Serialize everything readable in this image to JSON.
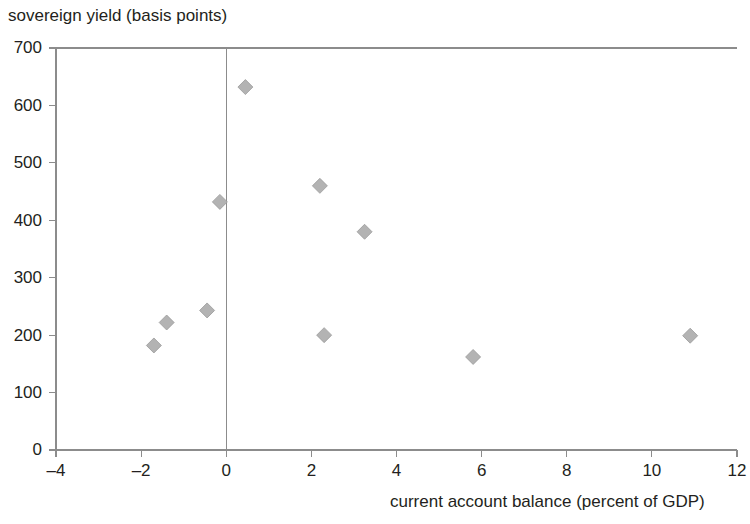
{
  "chart_data": {
    "type": "scatter",
    "title": "",
    "ylabel": "sovereign yield (basis points)",
    "xlabel": "current account balance (percent of GDP)",
    "xlim": [
      -4,
      12
    ],
    "ylim": [
      0,
      700
    ],
    "xticks": [
      -4,
      -2,
      0,
      2,
      4,
      6,
      8,
      10,
      12
    ],
    "yticks": [
      0,
      100,
      200,
      300,
      400,
      500,
      600,
      700
    ],
    "xtick_labels": [
      "–4",
      "–2",
      "0",
      "2",
      "4",
      "6",
      "8",
      "10",
      "12"
    ],
    "ytick_labels": [
      "0",
      "100",
      "200",
      "300",
      "400",
      "500",
      "600",
      "700"
    ],
    "grid": false,
    "legend": null,
    "marker": "diamond",
    "marker_color": "#b3b3b3",
    "marker_edge_color": "#9a9a9a",
    "zero_line_x": 0,
    "points": [
      {
        "x": -1.7,
        "y": 182
      },
      {
        "x": -1.4,
        "y": 222
      },
      {
        "x": -0.45,
        "y": 243
      },
      {
        "x": -0.15,
        "y": 432
      },
      {
        "x": 0.45,
        "y": 632
      },
      {
        "x": 2.2,
        "y": 460
      },
      {
        "x": 2.3,
        "y": 200
      },
      {
        "x": 3.25,
        "y": 380
      },
      {
        "x": 5.8,
        "y": 162
      },
      {
        "x": 10.9,
        "y": 199
      }
    ]
  },
  "colors": {
    "axis": "#8c8c8c",
    "text": "#231f20",
    "marker": "#b3b3b3",
    "background": "#ffffff"
  }
}
